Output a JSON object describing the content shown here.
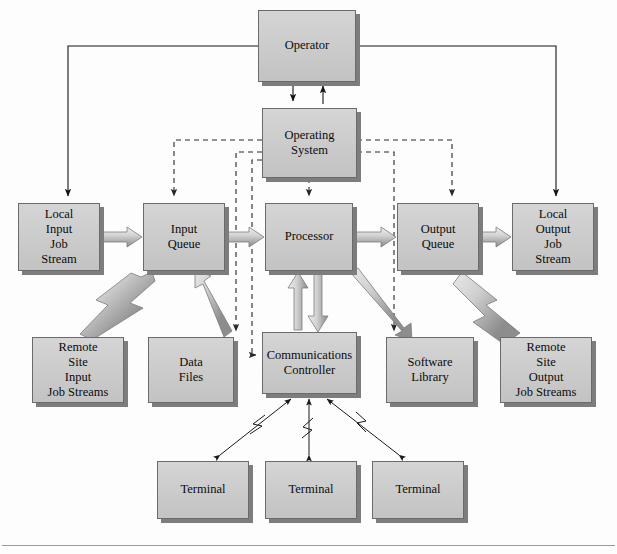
{
  "diagram": {
    "colors": {
      "box_fill": "#c9c9c9",
      "box_border": "#6b6b6b",
      "box_shadow": "#7d7d7d",
      "solid_line": "#1a1a1a",
      "dashed_line": "#2b2b2b",
      "thick_arrow_light": "#d6d6d6",
      "thick_arrow_dark": "#8f8f8f",
      "background": "#fdfdfd"
    },
    "nodes": [
      {
        "id": "operator",
        "label": "Operator",
        "x": 258,
        "y": 10,
        "w": 98,
        "h": 72
      },
      {
        "id": "operating_system",
        "label": "Operating System",
        "x": 262,
        "y": 108,
        "w": 95,
        "h": 70
      },
      {
        "id": "local_input_job_stream",
        "label": "Local\nInput\nJob\nStream",
        "x": 18,
        "y": 203,
        "w": 82,
        "h": 68
      },
      {
        "id": "input_queue",
        "label": "Input\nQueue",
        "x": 143,
        "y": 203,
        "w": 82,
        "h": 68
      },
      {
        "id": "processor",
        "label": "Processor",
        "x": 265,
        "y": 203,
        "w": 88,
        "h": 68
      },
      {
        "id": "output_queue",
        "label": "Output\nQueue",
        "x": 397,
        "y": 203,
        "w": 82,
        "h": 68
      },
      {
        "id": "local_output_job_stream",
        "label": "Local\nOutput\nJob\nStream",
        "x": 512,
        "y": 203,
        "w": 82,
        "h": 68
      },
      {
        "id": "remote_site_input",
        "label": "Remote\nSite\nInput\nJob Streams",
        "x": 32,
        "y": 337,
        "w": 92,
        "h": 66
      },
      {
        "id": "data_files",
        "label": "Data\nFiles",
        "x": 148,
        "y": 337,
        "w": 86,
        "h": 66
      },
      {
        "id": "communications_controller",
        "label": "Communications\nController",
        "x": 262,
        "y": 332,
        "w": 95,
        "h": 62
      },
      {
        "id": "software_library",
        "label": "Software\nLibrary",
        "x": 386,
        "y": 337,
        "w": 88,
        "h": 66
      },
      {
        "id": "remote_site_output",
        "label": "Remote\nSite\nOutput\nJob Streams",
        "x": 500,
        "y": 337,
        "w": 92,
        "h": 66
      },
      {
        "id": "terminal_1",
        "label": "Terminal",
        "x": 157,
        "y": 461,
        "w": 92,
        "h": 58
      },
      {
        "id": "terminal_2",
        "label": "Terminal",
        "x": 265,
        "y": 461,
        "w": 92,
        "h": 58
      },
      {
        "id": "terminal_3",
        "label": "Terminal",
        "x": 372,
        "y": 461,
        "w": 92,
        "h": 58
      }
    ],
    "connections": [
      {
        "from": "operator",
        "to": "local_input_job_stream",
        "style": "solid-orthogonal",
        "arrow": "end"
      },
      {
        "from": "operator",
        "to": "local_output_job_stream",
        "style": "solid-orthogonal",
        "arrow": "end"
      },
      {
        "from": "operator",
        "to": "operating_system",
        "style": "solid-vertical",
        "arrow": "end"
      },
      {
        "from": "operating_system",
        "to": "operator",
        "style": "solid-vertical",
        "arrow": "end"
      },
      {
        "from": "operating_system",
        "to": "input_queue",
        "style": "dashed",
        "arrow": "end"
      },
      {
        "from": "operating_system",
        "to": "processor",
        "style": "dashed",
        "arrow": "end"
      },
      {
        "from": "operating_system",
        "to": "output_queue",
        "style": "dashed",
        "arrow": "end"
      },
      {
        "from": "operating_system",
        "to": "data_files",
        "style": "dashed",
        "arrow": "end"
      },
      {
        "from": "operating_system",
        "to": "software_library",
        "style": "dashed",
        "arrow": "end"
      },
      {
        "from": "operating_system",
        "to": "communications_controller",
        "style": "dashed",
        "arrow": "end"
      },
      {
        "from": "local_input_job_stream",
        "to": "input_queue",
        "style": "thick-block",
        "arrow": "end"
      },
      {
        "from": "input_queue",
        "to": "processor",
        "style": "thick-block",
        "arrow": "end"
      },
      {
        "from": "processor",
        "to": "output_queue",
        "style": "thick-block",
        "arrow": "end"
      },
      {
        "from": "output_queue",
        "to": "local_output_job_stream",
        "style": "thick-block",
        "arrow": "end"
      },
      {
        "from": "remote_site_input",
        "to": "input_queue",
        "style": "lightning",
        "arrow": "end"
      },
      {
        "from": "output_queue",
        "to": "remote_site_output",
        "style": "lightning",
        "arrow": "end"
      },
      {
        "from": "data_files",
        "to": "processor",
        "style": "thick-block",
        "arrow": "end"
      },
      {
        "from": "communications_controller",
        "to": "processor",
        "style": "thick-block",
        "arrow": "both"
      },
      {
        "from": "processor",
        "to": "software_library",
        "style": "thick-block",
        "arrow": "end"
      },
      {
        "from": "terminal_1",
        "to": "communications_controller",
        "style": "thin-lightning",
        "arrow": "both"
      },
      {
        "from": "terminal_2",
        "to": "communications_controller",
        "style": "thin-lightning",
        "arrow": "both"
      },
      {
        "from": "terminal_3",
        "to": "communications_controller",
        "style": "thin-lightning",
        "arrow": "both"
      }
    ]
  }
}
